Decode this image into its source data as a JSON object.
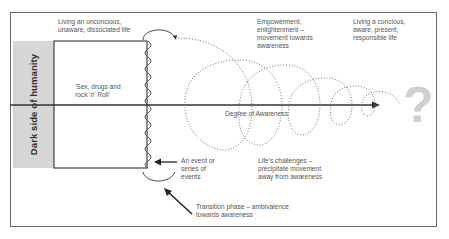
{
  "side_label": "Dark side of humanity",
  "labels": {
    "unconscious_life": [
      "Living an unconcious,",
      "unaware, dissociated life"
    ],
    "sex_drugs": [
      "'Sex, drugs and",
      "rock 'n' Roll'"
    ],
    "empowerment": [
      "Empowerment,",
      "enlightenment –",
      "movement towards",
      "awareness"
    ],
    "conscious_life": [
      "Living a concious,",
      "aware, present,",
      "responsible life"
    ],
    "axis": "Degree of Awareness",
    "event": [
      "An event or",
      "series of",
      "events"
    ],
    "challenges": [
      "Life's challenges –",
      "precipitate movement",
      "away from awareness"
    ],
    "transition": [
      "Transition phase – ambivalence",
      "towards awareness"
    ]
  },
  "icons": {
    "question_mark": "?"
  },
  "colors": {
    "frame": "#6a6a6a",
    "strip": "#d6d6d6",
    "line": "#333333",
    "question": "#cfcfcf"
  }
}
